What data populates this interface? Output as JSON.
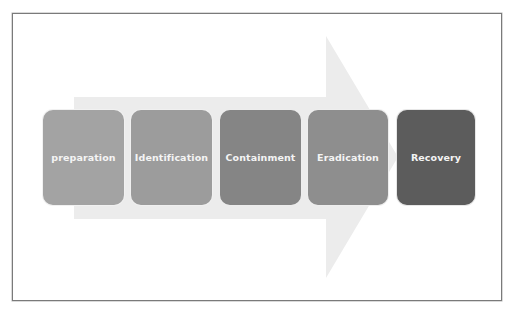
{
  "diagram": {
    "type": "process-flow",
    "arrow": {
      "color": "#ececec",
      "direction": "right"
    },
    "steps": [
      {
        "label": "preparation",
        "color": "#a3a3a3"
      },
      {
        "label": "Identification",
        "color": "#9c9c9c"
      },
      {
        "label": "Containment",
        "color": "#858585"
      },
      {
        "label": "Eradication",
        "color": "#8e8e8e"
      },
      {
        "label": "Recovery",
        "color": "#5c5c5c"
      }
    ],
    "frame": {
      "border_color": "#7a7a7a"
    }
  }
}
